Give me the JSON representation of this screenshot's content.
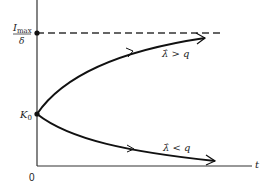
{
  "diagram": {
    "y_axis_labels": {
      "upper_numerator": "I",
      "upper_numerator_sub": "max",
      "upper_denominator": "δ",
      "lower": "K",
      "lower_sub": "0"
    },
    "x_axis_label": "t",
    "origin_label": "0",
    "curves": [
      {
        "name": "upper",
        "label": "λ̂ > q",
        "direction": "increasing toward I_max/δ asymptote"
      },
      {
        "name": "lower",
        "label": "λ̂ < q",
        "direction": "decreasing"
      }
    ],
    "asymptote": "dashed horizontal line at I_max/δ"
  }
}
